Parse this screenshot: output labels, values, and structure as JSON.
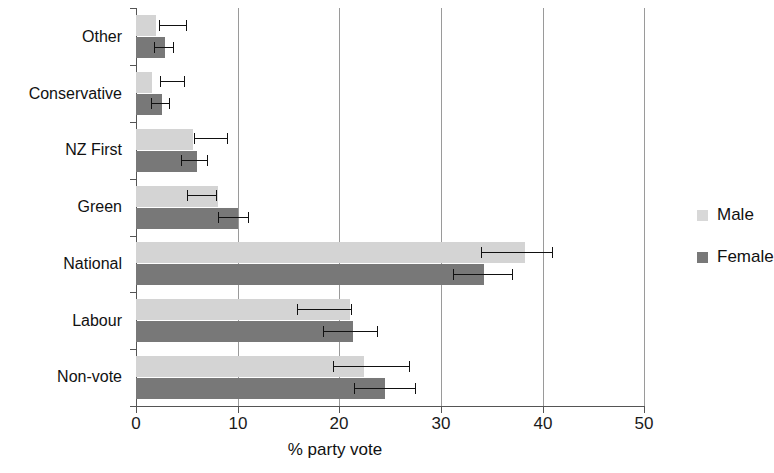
{
  "chart_data": {
    "type": "bar",
    "orientation": "horizontal",
    "title": "",
    "xlabel": "% party vote",
    "ylabel": "",
    "xlim": [
      0,
      50
    ],
    "xticks": [
      0,
      10,
      20,
      30,
      40,
      50
    ],
    "grid": "vertical gridlines at 10, 20, 30, 40, 50",
    "legend_position": "right",
    "categories": [
      "Non-vote",
      "Labour",
      "National",
      "Green",
      "NZ First",
      "Conservative",
      "Other"
    ],
    "series": [
      {
        "name": "Male",
        "color": "#d4d4d4",
        "values": [
          22.4,
          21.1,
          38.3,
          8.1,
          5.6,
          1.6,
          2.0
        ],
        "errors_low": [
          19.4,
          15.8,
          34.0,
          5.0,
          5.7,
          2.4,
          2.3
        ],
        "errors_high": [
          27.0,
          21.3,
          41.0,
          8.0,
          9.1,
          4.8,
          5.0
        ]
      },
      {
        "name": "Female",
        "color": "#787878",
        "values": [
          24.5,
          21.4,
          34.3,
          10.0,
          6.0,
          2.6,
          2.9
        ],
        "errors_low": [
          21.5,
          18.4,
          31.2,
          8.1,
          4.4,
          1.5,
          1.8
        ],
        "errors_high": [
          27.6,
          23.8,
          37.1,
          11.1,
          7.1,
          3.3,
          3.7
        ]
      }
    ]
  },
  "axis": {
    "x_title": "% party vote",
    "tick_labels": [
      "0",
      "10",
      "20",
      "30",
      "40",
      "50"
    ]
  },
  "categories": {
    "c0": "Non-vote",
    "c1": "Labour",
    "c2": "National",
    "c3": "Green",
    "c4": "NZ First",
    "c5": "Conservative",
    "c6": "Other"
  },
  "legend": {
    "items": [
      {
        "label": "Male",
        "color": "#d4d4d4"
      },
      {
        "label": "Female",
        "color": "#787878"
      }
    ]
  }
}
